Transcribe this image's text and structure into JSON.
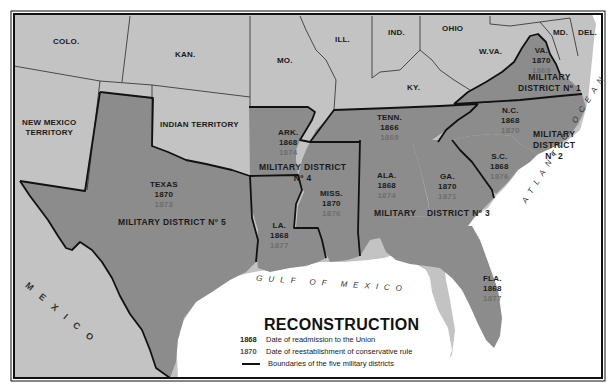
{
  "map": {
    "title": "RECONSTRUCTION",
    "colors": {
      "union_states": "#c3c3c3",
      "confederate_states": "#8c8c8c",
      "water": "#ffffff",
      "boundary": "#111111",
      "readmission_year": "#1a1a1a",
      "conservative_year": "#6e6e6e"
    },
    "non_confederate_labels": {
      "colo": "COLO.",
      "kan": "KAN.",
      "mo": "MO.",
      "ill": "ILL.",
      "ind": "IND.",
      "ohio": "OHIO",
      "wva": "W.VA.",
      "md": "MD.",
      "del": "DEL.",
      "ky": "KY.",
      "new_mexico_1": "NEW MEXICO",
      "new_mexico_2": "TERRITORY",
      "indian_territory": "INDIAN TERRITORY",
      "mexico": "MEXICO"
    },
    "states": [
      {
        "name": "VA.",
        "readmitted": "1870",
        "conservative_rule": "1869"
      },
      {
        "name": "N.C.",
        "readmitted": "1868",
        "conservative_rule": "1870"
      },
      {
        "name": "S.C.",
        "readmitted": "1868",
        "conservative_rule": "1876"
      },
      {
        "name": "TENN.",
        "readmitted": "1866",
        "conservative_rule": "1869"
      },
      {
        "name": "GA.",
        "readmitted": "1870",
        "conservative_rule": "1871"
      },
      {
        "name": "ALA.",
        "readmitted": "1868",
        "conservative_rule": "1874"
      },
      {
        "name": "FLA.",
        "readmitted": "1868",
        "conservative_rule": "1877"
      },
      {
        "name": "MISS.",
        "readmitted": "1870",
        "conservative_rule": "1876"
      },
      {
        "name": "ARK.",
        "readmitted": "1868",
        "conservative_rule": "1874"
      },
      {
        "name": "LA.",
        "readmitted": "1868",
        "conservative_rule": "1877"
      },
      {
        "name": "TEXAS",
        "readmitted": "1870",
        "conservative_rule": "1873"
      }
    ],
    "districts": {
      "d1_line1": "MILITARY",
      "d1_line2": "DISTRICT Nº 1",
      "d2_line1": "MILITARY",
      "d2_line2": "DISTRICT",
      "d2_line3": "Nº 2",
      "d3_a": "MILITARY",
      "d3_b": "DISTRICT Nº 3",
      "d4_line1": "MILITARY DISTRICT",
      "d4_line2": "Nº 4",
      "d5": "MILITARY DISTRICT Nº 5"
    },
    "water_labels": {
      "gulf": "GULF OF MEXICO",
      "atlantic": "ATLANTIC OCEAN"
    },
    "legend": {
      "title": "RECONSTRUCTION",
      "items": [
        {
          "key": "1868",
          "text": "Date of readmission to the Union"
        },
        {
          "key": "1870",
          "text": "Date of reestablishment of conservative rule"
        },
        {
          "key": "line",
          "text": "Boundaries of the five military districts"
        }
      ]
    }
  }
}
